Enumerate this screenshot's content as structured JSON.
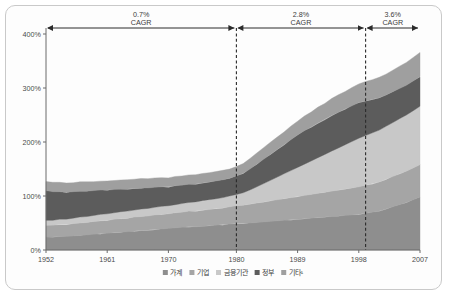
{
  "chart_data": {
    "type": "area",
    "stacked": true,
    "title": "",
    "subtitle": "",
    "xlabel": "",
    "ylabel": "",
    "xlim": [
      1952,
      2007
    ],
    "ylim": [
      0,
      400
    ],
    "yunit": "%",
    "grid": false,
    "legend_position": "bottom",
    "y_ticks": [
      "0%",
      "100%",
      "200%",
      "300%",
      "400%"
    ],
    "y_tick_values": [
      0,
      100,
      200,
      300,
      400
    ],
    "x_ticks": [
      "1952",
      "1961",
      "1970",
      "1980",
      "1989",
      "1998",
      "2007"
    ],
    "x_tick_values": [
      1952,
      1961,
      1970,
      1980,
      1989,
      1998,
      2007
    ],
    "x": [
      1952,
      1953,
      1954,
      1955,
      1956,
      1957,
      1958,
      1959,
      1960,
      1961,
      1962,
      1963,
      1964,
      1965,
      1966,
      1967,
      1968,
      1969,
      1970,
      1971,
      1972,
      1973,
      1974,
      1975,
      1976,
      1977,
      1978,
      1979,
      1980,
      1981,
      1982,
      1983,
      1984,
      1985,
      1986,
      1987,
      1988,
      1989,
      1990,
      1991,
      1992,
      1993,
      1994,
      1995,
      1996,
      1997,
      1998,
      1999,
      2000,
      2001,
      2002,
      2003,
      2004,
      2005,
      2006,
      2007
    ],
    "series": [
      {
        "name": "가계",
        "color": "#8e8e8e",
        "values": [
          24,
          24,
          25,
          25,
          26,
          27,
          28,
          29,
          30,
          31,
          32,
          33,
          34,
          35,
          36,
          37,
          38,
          39,
          40,
          41,
          42,
          43,
          43,
          44,
          45,
          46,
          47,
          48,
          49,
          49,
          50,
          51,
          52,
          53,
          54,
          55,
          56,
          57,
          58,
          59,
          60,
          61,
          62,
          63,
          64,
          65,
          66,
          68,
          70,
          72,
          76,
          80,
          84,
          88,
          93,
          98
        ]
      },
      {
        "name": "기업",
        "color": "#a5a5a5",
        "values": [
          22,
          22,
          22,
          22,
          23,
          23,
          23,
          24,
          24,
          24,
          25,
          25,
          25,
          26,
          26,
          26,
          27,
          27,
          27,
          28,
          28,
          29,
          29,
          30,
          30,
          31,
          31,
          32,
          33,
          34,
          35,
          36,
          37,
          38,
          39,
          40,
          41,
          42,
          43,
          44,
          45,
          46,
          47,
          48,
          49,
          50,
          51,
          52,
          53,
          54,
          55,
          56,
          57,
          58,
          59,
          60
        ]
      },
      {
        "name": "금융기관",
        "color": "#c8c8c8",
        "values": [
          9,
          9,
          10,
          10,
          10,
          11,
          11,
          11,
          12,
          12,
          12,
          13,
          13,
          13,
          14,
          14,
          14,
          15,
          15,
          15,
          16,
          16,
          17,
          17,
          18,
          18,
          19,
          20,
          21,
          23,
          26,
          30,
          34,
          38,
          42,
          46,
          50,
          54,
          58,
          62,
          66,
          70,
          74,
          78,
          82,
          86,
          90,
          92,
          94,
          96,
          98,
          100,
          102,
          104,
          106,
          108
        ]
      },
      {
        "name": "정부",
        "color": "#5c5c5c",
        "values": [
          55,
          53,
          51,
          50,
          49,
          48,
          47,
          46,
          45,
          44,
          43,
          42,
          41,
          40,
          39,
          38,
          37,
          36,
          35,
          35,
          34,
          34,
          33,
          33,
          33,
          33,
          33,
          33,
          34,
          36,
          39,
          42,
          45,
          48,
          51,
          54,
          57,
          60,
          62,
          63,
          64,
          65,
          66,
          66,
          66,
          66,
          66,
          64,
          62,
          60,
          58,
          57,
          56,
          55,
          55,
          55
        ]
      },
      {
        "name": "기타¹",
        "color": "#9f9f9f",
        "values": [
          17,
          17,
          17,
          17,
          17,
          17,
          17,
          17,
          17,
          17,
          17,
          17,
          17,
          17,
          17,
          17,
          17,
          17,
          17,
          17,
          17,
          17,
          17,
          17,
          17,
          17,
          17,
          17,
          17,
          18,
          19,
          20,
          21,
          22,
          23,
          24,
          25,
          26,
          27,
          28,
          29,
          30,
          31,
          32,
          33,
          34,
          35,
          36,
          37,
          38,
          39,
          40,
          41,
          42,
          43,
          45
        ]
      }
    ],
    "annotations": [
      {
        "label_value": "0.7%",
        "label_unit": "CAGR",
        "x_start": 1952,
        "x_end": 1980
      },
      {
        "label_value": "2.8%",
        "label_unit": "CAGR",
        "x_start": 1980,
        "x_end": 1999
      },
      {
        "label_value": "3.6%",
        "label_unit": "CAGR",
        "x_start": 1999,
        "x_end": 2007
      }
    ],
    "dividers": [
      1980,
      1999
    ],
    "legend": [
      {
        "label": "가계",
        "color": "#8e8e8e"
      },
      {
        "label": "기업",
        "color": "#a5a5a5"
      },
      {
        "label": "금융기관",
        "color": "#c8c8c8"
      },
      {
        "label": "정부",
        "color": "#5c5c5c"
      },
      {
        "label": "기타¹",
        "color": "#9f9f9f"
      }
    ]
  }
}
